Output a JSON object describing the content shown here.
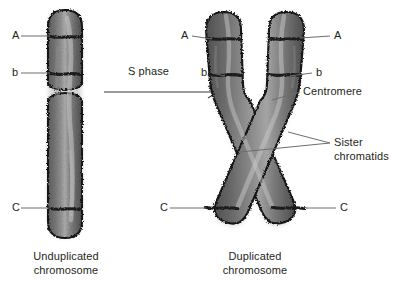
{
  "figure": {
    "title_visible": false,
    "background_color": "#ffffff",
    "ink_color": "#231f20",
    "chromosome_fill": "#6e6e6e",
    "chromosome_fill_dark": "#5a5a5a",
    "chromosome_highlight": "#cfcfcf",
    "chromosome_outline": "#1a1a1a",
    "band_color": "#1f1f1f",
    "leader_line_color": "#6d6d6d"
  },
  "left_panel": {
    "caption_line1": "Unduplicated",
    "caption_line2": "chromosome",
    "labels": [
      {
        "text": "A",
        "side": "left"
      },
      {
        "text": "b",
        "side": "left"
      },
      {
        "text": "C",
        "side": "left"
      }
    ]
  },
  "transition": {
    "label": "S phase",
    "arrow": "right-arrow"
  },
  "right_panel": {
    "caption_line1": "Duplicated",
    "caption_line2": "chromosome",
    "labels": [
      {
        "text": "A",
        "side": "left"
      },
      {
        "text": "b",
        "side": "left"
      },
      {
        "text": "C",
        "side": "left"
      },
      {
        "text": "A",
        "side": "right"
      },
      {
        "text": "b",
        "side": "right"
      },
      {
        "text": "C",
        "side": "right"
      },
      {
        "text": "Centromere",
        "side": "right"
      },
      {
        "text": "Sister",
        "side": "right"
      },
      {
        "text": "chromatids",
        "side": "right"
      }
    ]
  }
}
